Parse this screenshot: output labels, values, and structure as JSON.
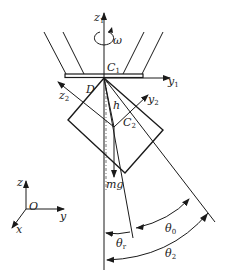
{
  "figure": {
    "type": "mechanics-diagram"
  },
  "labels": {
    "z1": {
      "main": "z",
      "sub": "1"
    },
    "omega": "ω",
    "C1": {
      "main": "C",
      "sub": "1"
    },
    "y1": {
      "main": "y",
      "sub": "1"
    },
    "D": "D",
    "z2": {
      "main": "z",
      "sub": "2"
    },
    "y2": {
      "main": "y",
      "sub": "2"
    },
    "h": "h",
    "C2": {
      "main": "C",
      "sub": "2"
    },
    "mg": "mg",
    "theta0": {
      "main": "θ",
      "sub": "0"
    },
    "theta_r": {
      "main": "θ",
      "sub": "r"
    },
    "theta2": {
      "main": "θ",
      "sub": "2"
    }
  },
  "global_axes": {
    "origin": "O",
    "z": "z",
    "y": "y",
    "x": "x"
  },
  "colors": {
    "ink": "#1a1a1a",
    "background": "#ffffff"
  }
}
